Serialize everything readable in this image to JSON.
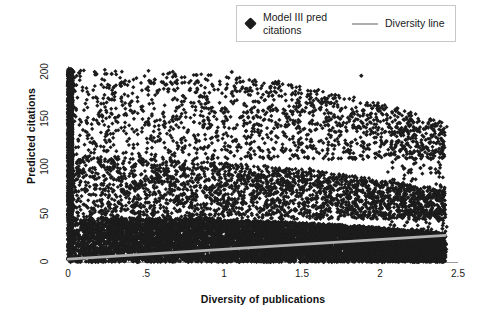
{
  "chart_data": {
    "type": "scatter",
    "title": "",
    "xlabel": "Diversity of publications",
    "ylabel": "Predicted citations",
    "xlim": [
      0,
      2.5
    ],
    "ylim": [
      0,
      205
    ],
    "grid": false,
    "legend_position": "top-right",
    "xticks": [
      "0",
      ".5",
      "1",
      "1.5",
      "2",
      "2.5"
    ],
    "xtick_values": [
      0,
      0.5,
      1,
      1.5,
      2,
      2.5
    ],
    "yticks": [
      "0",
      "50",
      "100",
      "150",
      "200"
    ],
    "ytick_values": [
      0,
      50,
      100,
      150,
      200
    ],
    "series": [
      {
        "name": "Model III pred citations",
        "type": "scatter",
        "marker": "diamond",
        "color": "#1c1c1c",
        "n_points": 6000,
        "x_range": [
          0,
          2.42
        ],
        "y_range": [
          0,
          203
        ],
        "density_note": "Saturated black mass below ~45 citations across all diversity values; sparse scattered diamonds from ~45 up to ~200; dense vertical column of points at diversity = 0 spanning 0 to 200 citations.",
        "sample_points": [
          {
            "x": 0.0,
            "y": 200
          },
          {
            "x": 0.0,
            "y": 185
          },
          {
            "x": 0.0,
            "y": 170
          },
          {
            "x": 0.0,
            "y": 150
          },
          {
            "x": 0.0,
            "y": 130
          },
          {
            "x": 0.0,
            "y": 110
          },
          {
            "x": 0.0,
            "y": 90
          },
          {
            "x": 0.0,
            "y": 70
          },
          {
            "x": 0.0,
            "y": 50
          },
          {
            "x": 0.0,
            "y": 30
          },
          {
            "x": 0.0,
            "y": 12
          },
          {
            "x": 0.0,
            "y": 3
          },
          {
            "x": 0.28,
            "y": 198
          },
          {
            "x": 0.35,
            "y": 165
          },
          {
            "x": 0.42,
            "y": 120
          },
          {
            "x": 0.55,
            "y": 188
          },
          {
            "x": 0.62,
            "y": 142
          },
          {
            "x": 0.7,
            "y": 95
          },
          {
            "x": 0.85,
            "y": 175
          },
          {
            "x": 0.95,
            "y": 132
          },
          {
            "x": 1.05,
            "y": 200
          },
          {
            "x": 1.15,
            "y": 158
          },
          {
            "x": 1.25,
            "y": 110
          },
          {
            "x": 1.35,
            "y": 190
          },
          {
            "x": 1.45,
            "y": 145
          },
          {
            "x": 1.55,
            "y": 98
          },
          {
            "x": 1.65,
            "y": 172
          },
          {
            "x": 1.78,
            "y": 125
          },
          {
            "x": 1.88,
            "y": 196
          },
          {
            "x": 1.98,
            "y": 150
          },
          {
            "x": 2.08,
            "y": 105
          },
          {
            "x": 2.18,
            "y": 78
          },
          {
            "x": 2.28,
            "y": 140
          },
          {
            "x": 2.35,
            "y": 60
          },
          {
            "x": 2.4,
            "y": 35
          }
        ]
      },
      {
        "name": "Diversity line",
        "type": "line",
        "color": "#b0b0b0",
        "x": [
          0,
          2.42
        ],
        "y": [
          3,
          28
        ]
      }
    ]
  },
  "legend": {
    "entries": [
      {
        "label": "Model III pred citations",
        "marker": "diamond-marker",
        "color": "#1c1c1c"
      },
      {
        "label": "Diversity line",
        "marker": "line-swatch",
        "color": "#aeaeae"
      }
    ]
  },
  "axes": {
    "x": {
      "title": "Diversity of publications",
      "ticks": [
        "0",
        ".5",
        "1",
        "1.5",
        "2",
        "2.5"
      ]
    },
    "y": {
      "title": "Predicted citations",
      "ticks": [
        "0",
        "50",
        "100",
        "150",
        "200"
      ]
    }
  }
}
